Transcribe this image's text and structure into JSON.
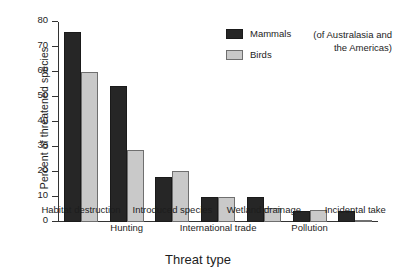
{
  "chart_data": {
    "type": "bar",
    "title": "",
    "xlabel": "Threat type",
    "ylabel": "Percent of threatened species",
    "ylim": [
      0,
      80
    ],
    "ytick_values": [
      80,
      70,
      60,
      50,
      40,
      30,
      20,
      10,
      0
    ],
    "ytick_labels": [
      "80",
      "70",
      "60",
      "50",
      "40",
      "30",
      "20",
      "10",
      "0"
    ],
    "grid": false,
    "legend_position": "upper-right-inside",
    "categories": [
      "Habitat destruction",
      "Hunting",
      "Introduced species",
      "International trade",
      "Wetland drainage",
      "Pollution",
      "Incidental take"
    ],
    "series": [
      {
        "name": "Mammals",
        "color": "#262626",
        "values": [
          76,
          54.5,
          18,
          10,
          10,
          4.5,
          4.5
        ]
      },
      {
        "name": "Birds",
        "color": "#c9c9c9",
        "values": [
          60,
          29,
          20.5,
          10,
          5.5,
          5,
          1
        ]
      }
    ],
    "annotation": "(of Australasia and the Americas)"
  },
  "axes": {
    "y_title": "Percent of threatened species",
    "x_title": "Threat type"
  },
  "legend": {
    "items": [
      {
        "label": "Mammals",
        "swatch": "mammals"
      },
      {
        "label": "Birds",
        "swatch": "birds"
      }
    ]
  },
  "annotation": {
    "line1": "(of Australasia and",
    "line2": "the Americas)"
  },
  "colors": {
    "mammals": "#262626",
    "birds": "#c9c9c9",
    "axis": "#333333",
    "text": "#1d1d1d",
    "background": "#ffffff"
  }
}
